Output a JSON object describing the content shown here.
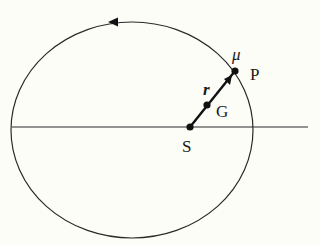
{
  "diagram": {
    "colors": {
      "stroke": "#2a2a2a",
      "background": "#fdfdf8",
      "point": "#111111"
    },
    "orbit": {
      "cx": 132,
      "cy": 130,
      "rx": 121,
      "ry": 108,
      "direction": "counterclockwise"
    },
    "axis_line": {
      "x1": 12,
      "y1": 127,
      "x2": 308,
      "y2": 127
    },
    "points": {
      "S": {
        "label": "S",
        "x": 190,
        "y": 127
      },
      "G": {
        "label": "G",
        "x": 207,
        "y": 105
      },
      "P": {
        "label": "P",
        "x": 235,
        "y": 71
      }
    },
    "labels": {
      "mu": "μ",
      "r": "r",
      "S": "S",
      "G": "G",
      "P": "P"
    }
  },
  "caption": ""
}
